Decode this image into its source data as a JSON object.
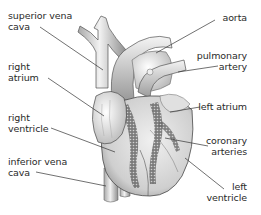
{
  "diagram": {
    "colors": {
      "background": "#ffffff",
      "text": "#2a2a2a",
      "leader_line": "#333333",
      "vessel_fill": "#e6e6e6",
      "vessel_shade": "#9a9a9a",
      "muscle_fill": "#d9d9d9",
      "coronary_dark": "#5a5a5a"
    },
    "labels": {
      "superior_vena_cava": {
        "line1": "superior vena",
        "line2": "cava"
      },
      "right_atrium": {
        "line1": "right",
        "line2": "atrium"
      },
      "right_ventricle": {
        "line1": "right",
        "line2": "ventricle"
      },
      "inferior_vena_cava": {
        "line1": "inferior vena",
        "line2": "cava"
      },
      "aorta": {
        "line1": "aorta"
      },
      "pulmonary_artery": {
        "line1": "pulmonary",
        "line2": "artery"
      },
      "left_atrium": {
        "line1": "left atrium"
      },
      "coronary_arteries": {
        "line1": "coronary",
        "line2": "arteries"
      },
      "left_ventricle": {
        "line1": "left",
        "line2": "ventricle"
      }
    }
  }
}
